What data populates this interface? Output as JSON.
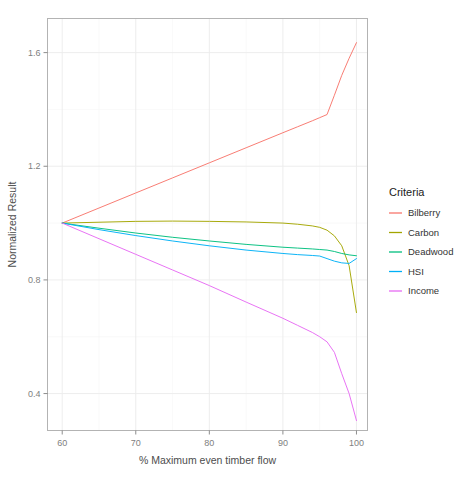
{
  "chart_data": {
    "type": "line",
    "title": "",
    "xlabel": "% Maximum even timber flow",
    "ylabel": "Normalized Result",
    "xlim": [
      58,
      101.5
    ],
    "ylim": [
      0.27,
      1.72
    ],
    "xticks": [
      60,
      70,
      80,
      90,
      100
    ],
    "yticks": [
      0.4,
      0.8,
      1.2,
      1.6
    ],
    "xtick_labels": [
      "60",
      "70",
      "80",
      "90",
      "100"
    ],
    "ytick_labels": [
      "0.4",
      "0.8",
      "1.2",
      "1.6"
    ],
    "grid": true,
    "legend_position": "right",
    "legend_title": "Criteria",
    "x": [
      60,
      65,
      70,
      75,
      80,
      85,
      90,
      92,
      94,
      95,
      96,
      97,
      98,
      99,
      100
    ],
    "series": [
      {
        "name": "Bilberry",
        "color": "#f8766d",
        "values": [
          1.0,
          1.053,
          1.106,
          1.159,
          1.212,
          1.265,
          1.318,
          1.339,
          1.36,
          1.371,
          1.382,
          1.45,
          1.52,
          1.58,
          1.635
        ]
      },
      {
        "name": "Carbon",
        "color": "#a3a500",
        "values": [
          1.0,
          1.003,
          1.006,
          1.007,
          1.006,
          1.004,
          1.0,
          0.996,
          0.99,
          0.985,
          0.975,
          0.955,
          0.92,
          0.85,
          0.685
        ]
      },
      {
        "name": "Deadwood",
        "color": "#00bf7d",
        "values": [
          1.0,
          0.982,
          0.965,
          0.95,
          0.937,
          0.925,
          0.915,
          0.912,
          0.909,
          0.907,
          0.905,
          0.9,
          0.893,
          0.888,
          0.885
        ]
      },
      {
        "name": "HSI",
        "color": "#00b0f6",
        "values": [
          1.0,
          0.977,
          0.956,
          0.937,
          0.92,
          0.905,
          0.893,
          0.889,
          0.886,
          0.884,
          0.875,
          0.866,
          0.86,
          0.858,
          0.875
        ]
      },
      {
        "name": "Income",
        "color": "#e76bf3",
        "values": [
          1.0,
          0.945,
          0.89,
          0.835,
          0.78,
          0.722,
          0.665,
          0.64,
          0.615,
          0.6,
          0.582,
          0.545,
          0.47,
          0.4,
          0.305
        ]
      }
    ]
  },
  "legend": {
    "title": "Criteria",
    "items": [
      {
        "label": "Bilberry",
        "color": "#f8766d"
      },
      {
        "label": "Carbon",
        "color": "#a3a500"
      },
      {
        "label": "Deadwood",
        "color": "#00bf7d"
      },
      {
        "label": "HSI",
        "color": "#00b0f6"
      },
      {
        "label": "Income",
        "color": "#e76bf3"
      }
    ]
  }
}
